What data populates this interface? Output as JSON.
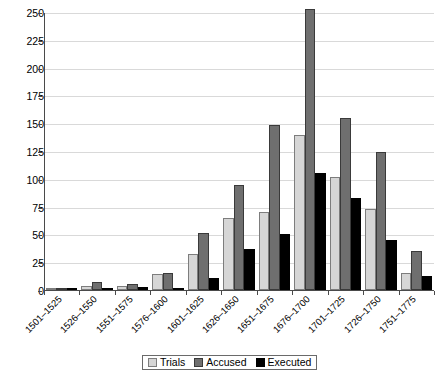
{
  "chart_data": {
    "type": "bar",
    "title": "",
    "subtitle": "",
    "xlabel": "",
    "ylabel": "",
    "ylim": [
      0,
      250
    ],
    "ytick_step": 25,
    "yticks": [
      "0",
      "25",
      "50",
      "75",
      "100",
      "125",
      "150",
      "175",
      "200",
      "225",
      "250"
    ],
    "grid": true,
    "legend_position": "bottom",
    "categories": [
      "1501–1525",
      "1526–1550",
      "1551–1575",
      "1576–1600",
      "1601–1625",
      "1626–1650",
      "1651–1675",
      "1676–1700",
      "1701–1725",
      "1726–1750",
      "1751–1775"
    ],
    "series": [
      {
        "name": "Trials",
        "color": "#d6d6d6",
        "values": [
          1,
          4,
          4,
          14,
          32,
          65,
          70,
          139,
          102,
          73,
          15
        ]
      },
      {
        "name": "Accused",
        "color": "#6f6f6f",
        "values": [
          1,
          7,
          5,
          15,
          51,
          94,
          148,
          253,
          155,
          124,
          35
        ]
      },
      {
        "name": "Executed",
        "color": "#000000",
        "values": [
          0,
          1,
          3,
          2,
          11,
          37,
          50,
          105,
          83,
          45,
          13
        ]
      }
    ]
  },
  "legend": {
    "entries": [
      {
        "label": "Trials",
        "swatch": "trials"
      },
      {
        "label": "Accused",
        "swatch": "accused"
      },
      {
        "label": "Executed",
        "swatch": "executed"
      }
    ]
  }
}
